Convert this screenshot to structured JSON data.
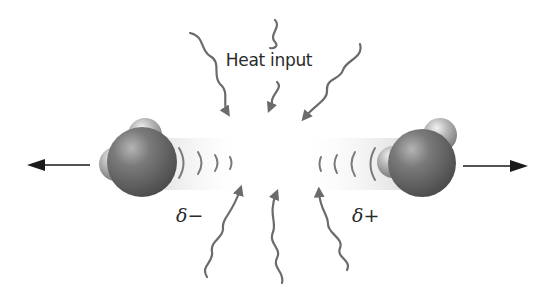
{
  "title": "Heat input",
  "labels": {
    "heat": "Heat input",
    "left_charge": "δ−",
    "right_charge": "δ+"
  },
  "colors": {
    "wavy_arrow": "#6b6b6b",
    "motion_arrow": "#1a1a1a",
    "oxygen_atom": "#6e6e6e",
    "hydrogen_atom": "#a9a9a9",
    "wave_arc": "#7a7a7a"
  },
  "elements": {
    "molecules": [
      {
        "name": "left-water-molecule",
        "direction": "left",
        "charge": "δ−"
      },
      {
        "name": "right-water-molecule",
        "direction": "right",
        "charge": "δ+"
      }
    ],
    "heat_arrows_count": 6,
    "wave_arcs_per_molecule": 4
  }
}
